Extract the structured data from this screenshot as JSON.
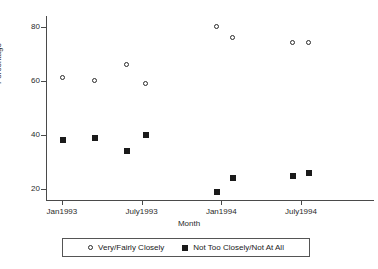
{
  "chart_data": {
    "type": "scatter",
    "title": "",
    "xlabel": "Month",
    "ylabel": "Percentage",
    "ylim": [
      16,
      84
    ],
    "yticks": [
      20,
      40,
      60,
      80
    ],
    "ytick_labels": [
      "20",
      "40",
      "60",
      "80"
    ],
    "xlim": [
      -1.2,
      23.5
    ],
    "xticks": [
      0,
      6,
      12,
      18
    ],
    "xtick_labels": [
      "Jan1993",
      "July1993",
      "Jan1994",
      "July1994"
    ],
    "grid": false,
    "legend_position": "below",
    "series": [
      {
        "name": "Very/Fairly Closely",
        "marker": "open-circle",
        "color": "#2a2a2a",
        "points": [
          {
            "x": 0.1,
            "y": 61
          },
          {
            "x": 2.5,
            "y": 60
          },
          {
            "x": 4.9,
            "y": 66
          },
          {
            "x": 6.3,
            "y": 59
          },
          {
            "x": 11.7,
            "y": 80
          },
          {
            "x": 12.9,
            "y": 76
          },
          {
            "x": 17.4,
            "y": 74
          },
          {
            "x": 18.6,
            "y": 74
          }
        ]
      },
      {
        "name": "Not Too Closely/Not At All",
        "marker": "filled-square",
        "color": "#1a1a1a",
        "points": [
          {
            "x": 0.1,
            "y": 38
          },
          {
            "x": 2.5,
            "y": 39
          },
          {
            "x": 4.9,
            "y": 34
          },
          {
            "x": 6.3,
            "y": 40
          },
          {
            "x": 11.7,
            "y": 19
          },
          {
            "x": 12.9,
            "y": 24
          },
          {
            "x": 17.4,
            "y": 25
          },
          {
            "x": 18.6,
            "y": 26
          }
        ]
      }
    ]
  },
  "legend": {
    "items": [
      {
        "label": "Very/Fairly Closely",
        "marker": "open-circle"
      },
      {
        "label": "Not Too Closely/Not At All",
        "marker": "filled-square"
      }
    ]
  }
}
